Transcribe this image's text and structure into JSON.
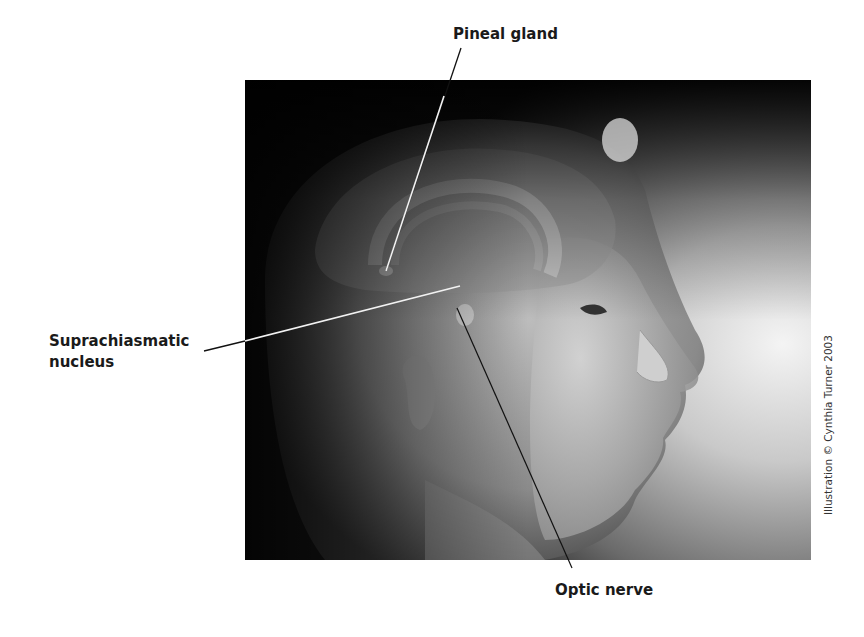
{
  "labels": {
    "pineal_gland": "Pineal gland",
    "scn_line1": "Suprachiasmatic",
    "scn_line2": "nucleus",
    "optic_nerve": "Optic nerve"
  },
  "credit": "Illustration © Cynthia Turner 2003",
  "illustration": {
    "subject": "profile of female head with brain anatomy overlay",
    "tone": "grayscale"
  },
  "colors": {
    "background": "#ffffff",
    "label_text": "#1a1a1a",
    "leader_light": "#f0f0f0",
    "leader_dark": "#111111"
  }
}
